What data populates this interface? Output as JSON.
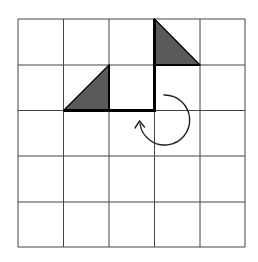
{
  "diagram": {
    "grid": {
      "rows": 5,
      "cols": 5,
      "x": [
        18,
        63.5,
        109,
        154.5,
        200,
        245
      ],
      "y": [
        19,
        65,
        110.5,
        156,
        202,
        247
      ],
      "line_color": "#444444"
    },
    "shapes": [
      {
        "name": "triangle-left",
        "points": "63.5,110.5 109,65 109,110.5",
        "fill": "#5a5a5a"
      },
      {
        "name": "triangle-top-right",
        "points": "154.5,19 200,65 154.5,65",
        "fill": "#5a5a5a"
      }
    ],
    "thick_path": "M63.5,110.5 L154.5,110.5 L154.5,19",
    "rotation_arrow": {
      "direction": "clockwise",
      "color": "#222222"
    },
    "colors": {
      "background": "#ffffff",
      "fill": "#5a5a5a",
      "outline": "#000000"
    }
  }
}
